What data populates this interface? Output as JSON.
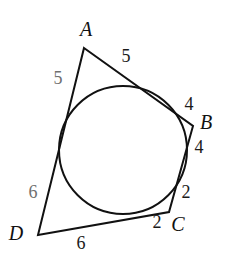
{
  "figure": {
    "kind": "tangential-quadrilateral-with-inscribed-circle",
    "background_color": "#ffffff",
    "stroke_color": "#111111",
    "muted_label_color": "#6f6f6f",
    "vertices": [
      {
        "name": "A",
        "label": "A",
        "point_x": 84,
        "point_y": 48,
        "label_x": 86,
        "label_y": 29
      },
      {
        "name": "B",
        "label": "B",
        "point_x": 193,
        "point_y": 126,
        "label_x": 206,
        "label_y": 122
      },
      {
        "name": "C",
        "label": "C",
        "point_x": 169,
        "point_y": 212,
        "label_x": 178,
        "label_y": 224
      },
      {
        "name": "D",
        "label": "D",
        "point_x": 38,
        "point_y": 235,
        "label_x": 16,
        "label_y": 233
      }
    ],
    "circle": {
      "center_x": 123,
      "center_y": 150,
      "radius": 64
    },
    "segment_labels": [
      {
        "name": "ab-upper",
        "text": "5",
        "x": 126,
        "y": 56,
        "muted": false
      },
      {
        "name": "ad-upper",
        "text": "5",
        "x": 58,
        "y": 78,
        "muted": true
      },
      {
        "name": "bc-upper",
        "text": "4",
        "x": 189,
        "y": 104,
        "muted": false
      },
      {
        "name": "bc-lower",
        "text": "4",
        "x": 199,
        "y": 147,
        "muted": false
      },
      {
        "name": "cb-short",
        "text": "2",
        "x": 186,
        "y": 192,
        "muted": false
      },
      {
        "name": "dc-right",
        "text": "2",
        "x": 157,
        "y": 222,
        "muted": false
      },
      {
        "name": "dc-lower",
        "text": "6",
        "x": 81,
        "y": 243,
        "muted": false
      },
      {
        "name": "ad-lower",
        "text": "6",
        "x": 33,
        "y": 192,
        "muted": true
      }
    ]
  }
}
